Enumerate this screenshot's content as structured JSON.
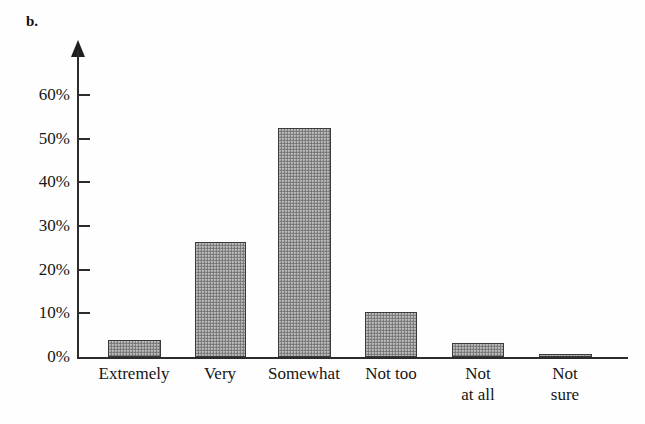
{
  "panel": {
    "letter": "b."
  },
  "chart_data": {
    "type": "bar",
    "title": "",
    "subtitle": "",
    "xlabel": "",
    "ylabel": "",
    "categories": [
      "Extremely",
      "Very",
      "Somewhat",
      "Not too",
      "Not\nat all",
      "Not\nsure"
    ],
    "values": [
      3.9,
      26.3,
      52.5,
      10.2,
      3.2,
      0.7
    ],
    "ylim": [
      0,
      65
    ],
    "ytick_values": [
      0,
      10,
      20,
      30,
      40,
      50,
      60
    ],
    "ytick_labels": [
      "0%",
      "10%",
      "20%",
      "30%",
      "40%",
      "50%",
      "60%"
    ],
    "grid": false,
    "legend": null,
    "legend_position": "none",
    "annotations": [
      "b."
    ],
    "colors": {
      "bar_fill": "#8b8b8b",
      "bar_edge": "#3a3a3a",
      "axis": "#2c2c2c",
      "text": "#151515",
      "background": "#fefefe"
    }
  }
}
